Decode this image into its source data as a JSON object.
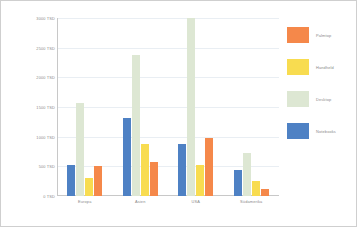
{
  "chart_data": {
    "type": "bar",
    "title": "",
    "xlabel": "",
    "ylabel": "",
    "ylim": [
      0,
      3000
    ],
    "grid": true,
    "legend_position": "right",
    "categories": [
      "Europa",
      "Asien",
      "USA",
      "Südamerika"
    ],
    "ytick_labels": [
      "3000 TSD",
      "2500 TSD",
      "2000 TSD",
      "1500 TSD",
      "1000 TSD",
      "500 TSD",
      "0 TSD"
    ],
    "ytick_values": [
      3000,
      2500,
      2000,
      1500,
      1000,
      500,
      0
    ],
    "unit": "TSD",
    "series": [
      {
        "name": "Notebooks",
        "color": "#4E81C4",
        "values": [
          520,
          1320,
          880,
          440
        ]
      },
      {
        "name": "Desktop",
        "color": "#DDE7D3",
        "values": [
          1560,
          2370,
          3000,
          720
        ]
      },
      {
        "name": "Handheld",
        "color": "#F8DC50",
        "values": [
          310,
          870,
          520,
          250
        ]
      },
      {
        "name": "Palmtop",
        "color": "#F5884A",
        "values": [
          500,
          580,
          980,
          120
        ]
      }
    ],
    "legend_order": [
      "Palmtop",
      "Handheld",
      "Desktop",
      "Notebooks"
    ]
  }
}
